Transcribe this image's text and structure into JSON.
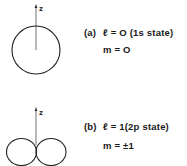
{
  "panel_a": {
    "axis_label": "z",
    "tag": "(a)",
    "l_line": "ℓ = O (1s  state)",
    "m_line": "m = O"
  },
  "panel_b": {
    "axis_label": "z",
    "tag": "(b)",
    "l_line": "ℓ = 1(2p  state)",
    "m_line": "m = ±1"
  }
}
